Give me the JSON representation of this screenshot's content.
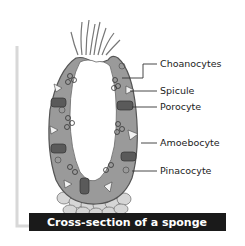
{
  "diagram": {
    "title": "Cross-section of a sponge",
    "labels": [
      {
        "id": "choanocytes",
        "text": "Choanocytes"
      },
      {
        "id": "spicule",
        "text": "Spicule"
      },
      {
        "id": "porocyte",
        "text": "Porocyte"
      },
      {
        "id": "amoebocyte",
        "text": "Amoebocyte"
      },
      {
        "id": "pinacocyte",
        "text": "Pinacocyte"
      }
    ],
    "colors": {
      "body_wall": "#9a9a9a",
      "body_outline": "#555555",
      "cavity": "#ffffff",
      "base_cells": "#d4d4d4",
      "porocyte": "#5a5a5a",
      "caption_bg": "#1a1a1a",
      "caption_text": "#ffffff",
      "bracket": "#d8d8d8",
      "leader_line": "#333333"
    }
  }
}
